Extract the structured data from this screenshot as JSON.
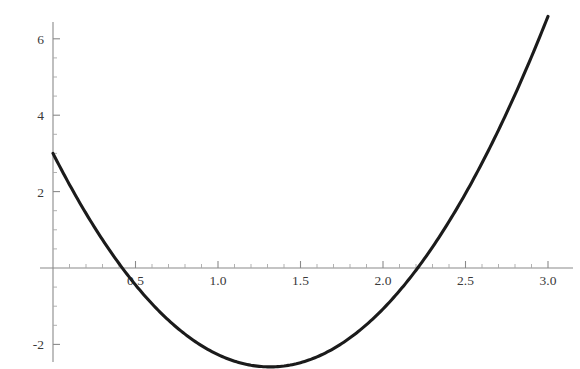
{
  "chart_data": {
    "type": "line",
    "title": "",
    "subtitle": "",
    "xlabel": "",
    "ylabel": "",
    "xlim": [
      -0.08,
      3.02
    ],
    "ylim": [
      -2.6,
      6.4
    ],
    "grid": false,
    "legend": null,
    "annotations": [],
    "axis_style": "mathematica-crossed-axes",
    "x_axis_position": 0,
    "y_axis_position": 0,
    "x_ticks_major": [
      0.5,
      1.0,
      1.5,
      2.0,
      2.5,
      3.0
    ],
    "x_tick_labels": [
      "0.5",
      "1.0",
      "1.5",
      "2.0",
      "2.5",
      "3.0"
    ],
    "x_ticks_minor": [
      0.1,
      0.2,
      0.3,
      0.4,
      0.6,
      0.7,
      0.8,
      0.9,
      1.1,
      1.2,
      1.3,
      1.4,
      1.6,
      1.7,
      1.8,
      1.9,
      2.1,
      2.2,
      2.3,
      2.4,
      2.6,
      2.7,
      2.8,
      2.9
    ],
    "y_ticks_major": [
      -2,
      2,
      4,
      6
    ],
    "y_tick_labels": [
      "-2",
      "2",
      "4",
      "6"
    ],
    "y_ticks_minor": [
      -1.5,
      -1.0,
      -0.5,
      0.5,
      1.0,
      1.5,
      2.5,
      3.0,
      3.5,
      4.5,
      5.0,
      5.5
    ],
    "series": [
      {
        "name": "curve",
        "color": "#1b1b1b",
        "line_width": 3.1,
        "function": "quadratic",
        "domain": [
          0,
          3
        ],
        "roots": [
          0.42,
          2.21
        ],
        "vertex": [
          1.315,
          -2.03
        ],
        "x": [
          0.0,
          0.15,
          0.3,
          0.42,
          0.6,
          0.75,
          0.9,
          1.05,
          1.2,
          1.315,
          1.45,
          1.6,
          1.75,
          1.9,
          2.05,
          2.21,
          2.4,
          2.55,
          2.7,
          2.85,
          3.0
        ],
        "y": [
          3.0,
          1.23,
          -0.29,
          -1.17,
          -1.94,
          -2.33,
          -2.53,
          -2.58,
          -2.47,
          -2.03,
          -1.96,
          -1.71,
          -1.31,
          -0.75,
          -0.02,
          0.0,
          1.4,
          2.36,
          3.47,
          4.67,
          6.0
        ]
      }
    ]
  },
  "plot": {
    "background_color": "#ffffff",
    "axis_color": "#8a8a8a",
    "tick_label_color": "#3a3a3a",
    "curve_color": "#1b1b1b"
  }
}
